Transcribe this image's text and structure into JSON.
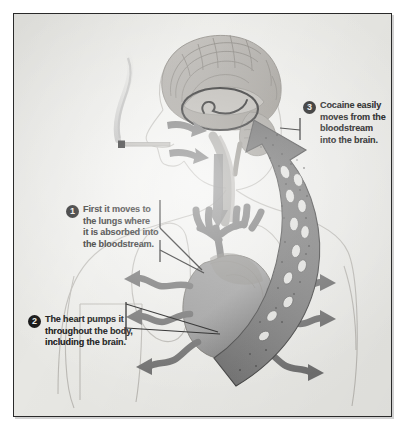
{
  "figure": {
    "kind": "medical-illustration",
    "frame_color": "#2a2a2a",
    "plate_color": "#e9e9e6",
    "ink_color": "#121212",
    "anatomy_color": "#7e7e7e",
    "arrow_color": "#6e6e6e"
  },
  "callouts": [
    {
      "number": "1",
      "name": "lungs-absorption",
      "lines": [
        "First it moves to",
        "the lungs where",
        "it is absorbed into",
        "the bloodstream."
      ]
    },
    {
      "number": "2",
      "name": "heart-pumping",
      "lines": [
        "The heart pumps it",
        "throughout the body,",
        "including the brain."
      ]
    },
    {
      "number": "3",
      "name": "brain-uptake",
      "lines": [
        "Cocaine easily",
        "moves from the",
        "bloodstream",
        "into the brain."
      ]
    }
  ],
  "anatomy_labels": {
    "brain": "brain-sagittal-section",
    "reward_circle": "highlighted-reward-region",
    "nose_arrow": "inhalation-arrow-nose",
    "mouth_arrow": "inhalation-arrow-mouth",
    "trachea": "trachea-airway",
    "heart": "heart-organ",
    "vessels": "branching-blood-vessels",
    "blood_arrow": "bloodstream-arrow-to-brain",
    "cigarette": "cigarette-with-smoke",
    "body_outline": "human-torso-head-outline"
  }
}
